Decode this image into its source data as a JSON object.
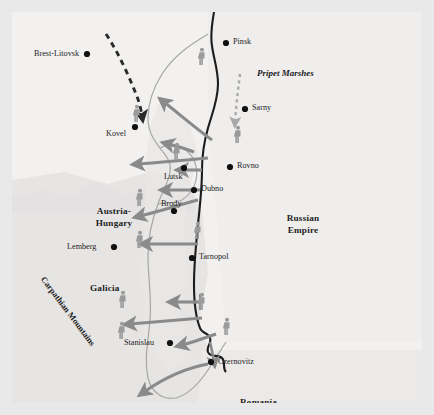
{
  "map": {
    "title": "Brusilov Offensive — Eastern Front 1916",
    "background_color": "#f2f1f0",
    "margin_color": "#e9e9e9",
    "arrow_color": "#8a8a8a",
    "dark_arrow_color": "#2b2b2b",
    "frontline_color": "#a9a9a9",
    "border_color": "#1d1d1d",
    "troop_icon_color": "#9a9a9a",
    "shade_color": "#e4e3e2"
  },
  "cities": [
    {
      "name": "Brest-Litovsk",
      "x": 75,
      "y": 42,
      "anchor": "right"
    },
    {
      "name": "Kovel",
      "x": 123,
      "y": 115,
      "anchor": "right"
    },
    {
      "name": "Pinsk",
      "x": 214,
      "y": 31,
      "anchor": "left"
    },
    {
      "name": "Sarny",
      "x": 233,
      "y": 97,
      "anchor": "left"
    },
    {
      "name": "Rovno",
      "x": 218,
      "y": 155,
      "anchor": "left"
    },
    {
      "name": "Lutsk",
      "x": 172,
      "y": 156,
      "anchor": "below-left"
    },
    {
      "name": "Dubno",
      "x": 182,
      "y": 178,
      "anchor": "left"
    },
    {
      "name": "Brody",
      "x": 162,
      "y": 199,
      "anchor": "above"
    },
    {
      "name": "Tarnopol",
      "x": 180,
      "y": 246,
      "anchor": "left"
    },
    {
      "name": "Lemberg",
      "x": 102,
      "y": 235,
      "anchor": "right"
    },
    {
      "name": "Stanislau",
      "x": 158,
      "y": 331,
      "anchor": "right"
    },
    {
      "name": "Czernovitz",
      "x": 199,
      "y": 350,
      "anchor": "left"
    }
  ],
  "regions": [
    {
      "name": "Austria-Hungary",
      "lines": [
        "Austria-",
        "Hungary"
      ],
      "x": 100,
      "y": 202
    },
    {
      "name": "Russian Empire",
      "lines": [
        "Russian",
        "Empire"
      ],
      "x": 291,
      "y": 209
    },
    {
      "name": "Galicia",
      "lines": [
        "Galicia"
      ],
      "x": 101,
      "y": 277
    },
    {
      "name": "Romania",
      "lines": [
        "Romania"
      ],
      "x": 253,
      "y": 391
    }
  ],
  "annotations": [
    {
      "name": "Pripet Marshes",
      "label": "Pripet Marshes",
      "x": 271,
      "y": 62,
      "style": "italic-bold"
    },
    {
      "name": "Carpathian Mountains",
      "label": "Carpathian Mountains",
      "x": 47,
      "y": 279,
      "style": "rotated"
    }
  ],
  "legend_semantics": {
    "solid_arrows": "Russian offensive thrusts (Brusilov Offensive)",
    "dashed_dark_arrow": "Reserve movement from Brest-Litovsk toward Kovel",
    "dashed_light_arrow": "Secondary movement south past Sarny",
    "thin_line": "Front line",
    "thick_dark_line": "International border",
    "figures": "Troop concentrations"
  },
  "troop_icons": [
    {
      "x": 190,
      "y": 45
    },
    {
      "x": 125,
      "y": 102
    },
    {
      "x": 226,
      "y": 123
    },
    {
      "x": 165,
      "y": 140
    },
    {
      "x": 128,
      "y": 186
    },
    {
      "x": 128,
      "y": 228
    },
    {
      "x": 186,
      "y": 219
    },
    {
      "x": 190,
      "y": 290
    },
    {
      "x": 111,
      "y": 288
    },
    {
      "x": 215,
      "y": 315
    },
    {
      "x": 110,
      "y": 319
    }
  ]
}
